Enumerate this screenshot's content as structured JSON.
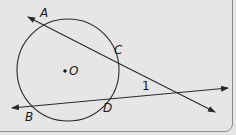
{
  "diagram": {
    "type": "geometry",
    "circle": {
      "center_label": "O",
      "cx": 68,
      "cy": 70,
      "r": 51
    },
    "points": {
      "A": "A",
      "B": "B",
      "C": "C",
      "D": "D",
      "O": "O"
    },
    "angle_label": "1",
    "lines": [
      {
        "name": "secant AC",
        "through": [
          "A",
          "C"
        ]
      },
      {
        "name": "secant BD",
        "through": [
          "B",
          "D"
        ]
      }
    ],
    "colors": {
      "background": "#e6e6e6",
      "stroke": "#2a2a2a"
    }
  }
}
